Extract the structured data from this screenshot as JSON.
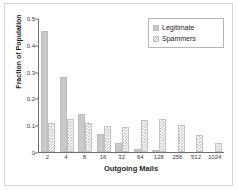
{
  "chart_data": {
    "type": "bar",
    "title": "",
    "xlabel": "Outgoing Mails",
    "ylabel": "Fraction of Population",
    "categories": [
      "2",
      "4",
      "8",
      "16",
      "32",
      "64",
      "128",
      "256",
      "512",
      "1024"
    ],
    "series": [
      {
        "name": "Legitimate",
        "values": [
          0.45,
          0.28,
          0.14,
          0.068,
          0.035,
          0.012,
          0.004,
          0.0,
          0.0,
          0.0
        ]
      },
      {
        "name": "Spammers",
        "values": [
          0.108,
          0.122,
          0.11,
          0.097,
          0.094,
          0.12,
          0.125,
          0.1,
          0.062,
          0.035
        ]
      }
    ],
    "ylim": [
      0,
      0.5
    ],
    "yticks": [
      "0",
      "0.1",
      "0.2",
      "0.3",
      "0.4",
      "0.5"
    ],
    "ytick_values": [
      0,
      0.1,
      0.2,
      0.3,
      0.4,
      0.5
    ],
    "grid": false,
    "legend_position": "top-right",
    "xscale": "log2-categorical",
    "colors": {
      "legitimate": "#c9c9c9",
      "spammers": "#bfbfbf",
      "axis": "#6e6e6e",
      "text": "#1f1f1f",
      "frame": "#d8d8d8"
    }
  },
  "legend": {
    "items": [
      {
        "label": "Legitimate",
        "swatch": "legend-swatch-legitimate"
      },
      {
        "label": "Spammers",
        "swatch": "legend-swatch-spammers"
      }
    ]
  }
}
